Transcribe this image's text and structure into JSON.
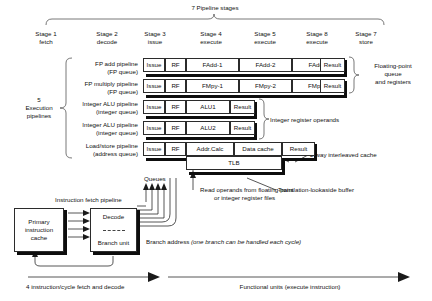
{
  "header": {
    "top_label": "7 Pipeline stages",
    "stages": [
      {
        "num": "Stage 1",
        "name": "fetch"
      },
      {
        "num": "Stage 2",
        "name": "decode"
      },
      {
        "num": "Stage 3",
        "name": "issue"
      },
      {
        "num": "Stage 4",
        "name": "execute"
      },
      {
        "num": "Stage 5",
        "name": "execute"
      },
      {
        "num": "Stage 8",
        "name": "execute"
      },
      {
        "num": "Stage 7",
        "name": "store"
      }
    ]
  },
  "left_brace_label": {
    "line1": "5",
    "line2": "Execution",
    "line3": "pipelines"
  },
  "pipelines": [
    {
      "label_line1": "FP add pipeline",
      "label_line2": "(FP queue)",
      "stages": [
        "Issue",
        "RF",
        "FAdd-1",
        "FAdd-2",
        "FAdd-3",
        "Result"
      ]
    },
    {
      "label_line1": "FP multiply pipeline",
      "label_line2": "(FP queue)",
      "stages": [
        "Issue",
        "RF",
        "FMpy-1",
        "FMpy-2",
        "FMpy-3",
        "Result"
      ]
    },
    {
      "label_line1": "Integer ALU pipeline",
      "label_line2": "(integer queue)",
      "stages": [
        "Issue",
        "RF",
        "ALU1",
        "Result"
      ]
    },
    {
      "label_line1": "Integer ALU pipeline",
      "label_line2": "(integer queue)",
      "stages": [
        "Issue",
        "RF",
        "ALU2",
        "Result"
      ]
    },
    {
      "label_line1": "Load/store pipeline",
      "label_line2": "(address queue)",
      "stages": [
        "Issue",
        "RF",
        "Addr.Calc",
        "Data cache",
        "Result"
      ],
      "sub_stage": "TLB"
    }
  ],
  "annotations": {
    "fp_queue": {
      "line1": "Floating-point",
      "line2": "queue",
      "line3": "and registers"
    },
    "integer_registers": "Integer register operands",
    "interleaved_cache": "2-way interleaved cache",
    "tlb_note": "Translation-lookaside buffer",
    "queues_label": "Queues",
    "read_operands": {
      "line1": "Read operands from floating-point",
      "line2": "or integer register files"
    },
    "instruction_fetch_pipeline": "Instruction fetch pipeline",
    "branch_address_prefix": "Branch address ",
    "branch_address_italic": "(one branch can be handled each cycle)"
  },
  "front_end": {
    "icache": {
      "line1": "Primary",
      "line2": "instruction",
      "line3": "cache"
    },
    "decode": "Decode",
    "branch_unit": "Branch unit"
  },
  "footer": {
    "left": "4 instruction/cycle fetch and decode",
    "right": "Functional units (execute instruction)"
  },
  "colors": {
    "stroke": "#2b2b2b",
    "shadow": "#0d0d0d",
    "background": "#ffffff",
    "text": "#111111"
  }
}
